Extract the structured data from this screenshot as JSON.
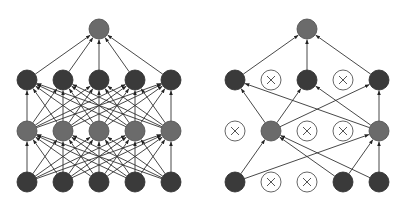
{
  "diagram": {
    "title": "",
    "colors": {
      "input_node": "#3a3a3a",
      "hidden1_node": "#6b6b6b",
      "hidden2_node": "#3a3a3a",
      "output_node": "#6b6b6b",
      "dropped_node_fill": "#ffffff",
      "edge": "#333333"
    },
    "node_radius": 10,
    "networks": [
      {
        "name": "standard-neural-net",
        "layers": [
          {
            "name": "input",
            "y": 182,
            "style": "dark",
            "x": [
              27,
              63,
              99,
              135,
              171
            ],
            "dropped": [
              false,
              false,
              false,
              false,
              false
            ]
          },
          {
            "name": "hidden1",
            "y": 131,
            "style": "mid",
            "x": [
              27,
              63,
              99,
              135,
              171
            ],
            "dropped": [
              false,
              false,
              false,
              false,
              false
            ]
          },
          {
            "name": "hidden2",
            "y": 80,
            "style": "dark",
            "x": [
              27,
              63,
              99,
              135,
              171
            ],
            "dropped": [
              false,
              false,
              false,
              false,
              false
            ]
          },
          {
            "name": "output",
            "y": 29,
            "style": "mid",
            "x": [
              99
            ],
            "dropped": [
              false
            ]
          }
        ],
        "connectivity": "full"
      },
      {
        "name": "after-dropout",
        "layers": [
          {
            "name": "input",
            "y": 182,
            "style": "dark",
            "x": [
              235,
              271,
              307,
              343,
              379
            ],
            "dropped": [
              false,
              true,
              true,
              false,
              false
            ]
          },
          {
            "name": "hidden1",
            "y": 131,
            "style": "mid",
            "x": [
              235,
              271,
              307,
              343,
              379
            ],
            "dropped": [
              true,
              false,
              true,
              true,
              false
            ]
          },
          {
            "name": "hidden2",
            "y": 80,
            "style": "dark",
            "x": [
              235,
              271,
              307,
              343,
              379
            ],
            "dropped": [
              false,
              true,
              false,
              true,
              false
            ]
          },
          {
            "name": "output",
            "y": 29,
            "style": "mid",
            "x": [
              307
            ],
            "dropped": [
              false
            ]
          }
        ],
        "connectivity": "active-only"
      }
    ]
  }
}
